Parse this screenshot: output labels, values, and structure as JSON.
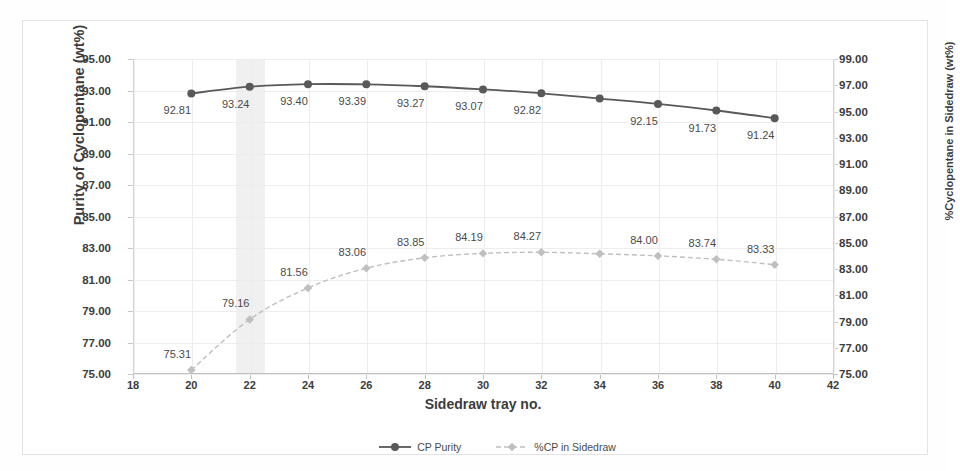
{
  "chart_data": {
    "type": "line",
    "title": "",
    "xlabel": "Sidedraw tray no.",
    "ylabel": "Purity of Cyclopentane (wt%)",
    "y2label": "%Cyclopentane in Sidedraw (wt%)",
    "x": [
      20,
      22,
      24,
      26,
      28,
      30,
      32,
      34,
      36,
      38,
      40
    ],
    "xlim": [
      18,
      42
    ],
    "xticks": [
      "18",
      "20",
      "22",
      "24",
      "26",
      "28",
      "30",
      "32",
      "34",
      "36",
      "38",
      "40",
      "42"
    ],
    "ylim": [
      75,
      95
    ],
    "yticks": [
      "75.00",
      "77.00",
      "79.00",
      "81.00",
      "83.00",
      "85.00",
      "87.00",
      "89.00",
      "91.00",
      "93.00",
      "95.00"
    ],
    "y2lim": [
      75,
      99
    ],
    "y2ticks": [
      "75.00",
      "77.00",
      "79.00",
      "81.00",
      "83.00",
      "85.00",
      "87.00",
      "89.00",
      "91.00",
      "93.00",
      "95.00",
      "97.00",
      "99.00"
    ],
    "grid": true,
    "legend_position": "bottom",
    "highlight_band": {
      "from": 21.5,
      "to": 22.5,
      "color": "#ebebeb"
    },
    "series": [
      {
        "name": "CP Purity",
        "axis": "left",
        "color": "#595959",
        "style": "solid",
        "marker": "circle",
        "values": [
          92.81,
          93.24,
          93.4,
          93.39,
          93.27,
          93.07,
          92.82,
          92.49,
          92.15,
          91.73,
          91.24
        ],
        "labels": [
          "92.81",
          "93.24",
          "93.40",
          "93.39",
          "93.27",
          "93.07",
          "92.82",
          "",
          "92.15",
          "91.73",
          "91.24"
        ]
      },
      {
        "name": "%CP in Sidedraw",
        "axis": "right",
        "color": "#bfbfbf",
        "style": "dashed",
        "marker": "diamond",
        "values": [
          75.31,
          79.16,
          81.56,
          83.06,
          83.85,
          84.19,
          84.27,
          84.16,
          84.0,
          83.74,
          83.33
        ],
        "labels": [
          "75.31",
          "79.16",
          "81.56",
          "83.06",
          "83.85",
          "84.19",
          "84.27",
          "",
          "84.00",
          "83.74",
          "83.33"
        ]
      }
    ]
  },
  "legend": {
    "items": [
      {
        "label": "CP Purity"
      },
      {
        "label": "%CP in Sidedraw"
      }
    ]
  },
  "colors": {
    "series_primary": "#595959",
    "series_secondary": "#bfbfbf",
    "grid": "#ededed",
    "axis": "#bfbfbf",
    "frame": "#e3e3e3",
    "highlight": "#ebebeb"
  }
}
